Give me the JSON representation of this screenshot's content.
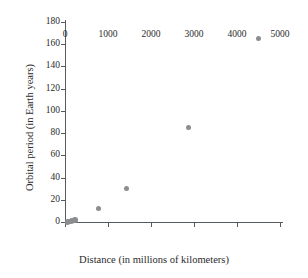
{
  "chart_data": {
    "type": "scatter",
    "title": "",
    "xlabel": "Distance (in millions of kilometers)",
    "ylabel": "Orbital period (in Earth years)",
    "xlim": [
      0,
      5000
    ],
    "ylim": [
      0,
      180
    ],
    "xticks": [
      0,
      1000,
      2000,
      3000,
      4000,
      5000
    ],
    "yticks": [
      0,
      20,
      40,
      60,
      80,
      100,
      120,
      140,
      160,
      180
    ],
    "xtick_labels": [
      "0",
      "1000",
      "2000",
      "3000",
      "4000",
      "5000"
    ],
    "ytick_labels": [
      "0",
      "20",
      "40",
      "60",
      "80",
      "100",
      "120",
      "140",
      "160",
      "180"
    ],
    "grid": false,
    "legend": null,
    "marker_color": "#8b8d8f",
    "axis_color": "#555b5e",
    "points": [
      {
        "x": 58,
        "y": 0.2
      },
      {
        "x": 108,
        "y": 0.6
      },
      {
        "x": 150,
        "y": 1.0
      },
      {
        "x": 228,
        "y": 1.9
      },
      {
        "x": 778,
        "y": 12
      },
      {
        "x": 1430,
        "y": 30
      },
      {
        "x": 2870,
        "y": 85
      },
      {
        "x": 4500,
        "y": 165
      }
    ]
  }
}
